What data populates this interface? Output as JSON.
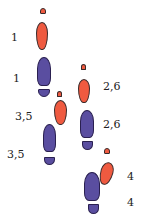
{
  "colors": {
    "left_foot": "#ef5a40",
    "right_foot": "#5a4ea0",
    "outline": "#3a2a2a",
    "background": "#ffffff"
  },
  "labels": {
    "l1": "1",
    "l2": "1",
    "l3": "3,5",
    "l4": "3,5",
    "l5": "2,6",
    "l6": "2,6",
    "l7": "4",
    "l8": "4"
  },
  "footprints": [
    {
      "foot": "left",
      "color": "red",
      "step": "1"
    },
    {
      "foot": "right",
      "color": "blue",
      "step": "1"
    },
    {
      "foot": "left",
      "color": "red",
      "step": "3,5"
    },
    {
      "foot": "right",
      "color": "blue",
      "step": "3,5"
    },
    {
      "foot": "left",
      "color": "red",
      "step": "2,6"
    },
    {
      "foot": "right",
      "color": "blue",
      "step": "2,6"
    },
    {
      "foot": "left",
      "color": "red",
      "step": "4"
    },
    {
      "foot": "right",
      "color": "blue",
      "step": "4"
    }
  ]
}
